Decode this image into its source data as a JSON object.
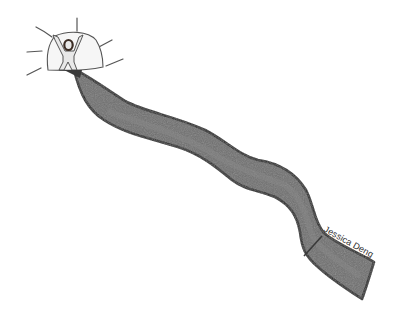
{
  "illustration": {
    "subject": "hand-drawn sketch of a winding road leading to a glowing doorway with a figure with raised arms",
    "colors": {
      "background": "#ffffff",
      "road_fill": "#6f6f6f",
      "road_outline": "#2a2a2a",
      "doorway_fill": "#f4f4f4",
      "figure_fill": "#e6e6e6",
      "figure_head": "#4a3a32",
      "rays": "#555555"
    },
    "elements": [
      "light-rays",
      "doorway-arch",
      "figure-arms-raised",
      "winding-road"
    ]
  },
  "signature": {
    "text": "Jessica Deng"
  }
}
